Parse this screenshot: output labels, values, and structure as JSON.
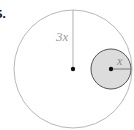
{
  "problem": {
    "number": "5."
  },
  "diagram": {
    "outer_circle": {
      "radius_label": "3x",
      "stroke": "#b8b8b8",
      "fill": "#ffffff"
    },
    "inner_circle": {
      "radius_label": "x",
      "stroke": "#555555",
      "fill": "#dcdcdc"
    },
    "center_dot_color": "#111111",
    "label_color": "#9a9a9a"
  }
}
